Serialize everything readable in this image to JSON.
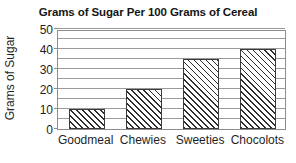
{
  "chart_data": {
    "type": "bar",
    "title": "Grams of Sugar Per 100 Grams of Cereal",
    "xlabel": "",
    "ylabel": "Grams of Sugar",
    "categories": [
      "Goodmeal",
      "Chewies",
      "Sweeties",
      "Chocolots"
    ],
    "values": [
      10,
      20,
      35,
      40
    ],
    "ylim": [
      0,
      50
    ],
    "ytick_labels": [
      "0",
      "10",
      "20",
      "30",
      "40",
      "50"
    ],
    "ytick_values": [
      0,
      10,
      20,
      30,
      40,
      50
    ],
    "gridline_values": [
      5,
      10,
      15,
      20,
      25,
      30,
      35,
      40,
      45,
      50
    ],
    "grid": "horizontal",
    "legend": "none",
    "bar_fill": "diagonal-hatch",
    "colors": {
      "background": "#ffffff",
      "axis": "#8d8d8d",
      "grid": "#9a9a9a",
      "bar_edge": "#3a3a3a",
      "bar_hatch": "#2e2e2e",
      "text": "#1f1f1f",
      "title_text": "#161616"
    }
  }
}
